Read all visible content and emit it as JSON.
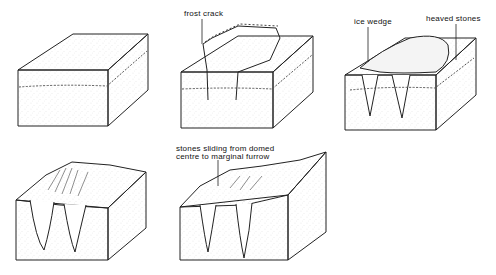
{
  "diagram": {
    "panels": [
      {
        "id": 1,
        "stage": "initial block with stone layer"
      },
      {
        "id": 2,
        "stage": "frost crack",
        "label": "frost crack"
      },
      {
        "id": 3,
        "stage": "ice wedge and heaved stones",
        "labels": [
          "ice wedge",
          "heaved stones"
        ]
      },
      {
        "id": 4,
        "stage": "domed centre with radiating stones"
      },
      {
        "id": 5,
        "stage": "stones sliding to marginal furrow",
        "label_lines": [
          "stones sliding from domed",
          "centre to marginal furrow"
        ]
      }
    ]
  },
  "labels": {
    "frost_crack": "frost crack",
    "ice_wedge": "ice wedge",
    "heaved_stones": "heaved stones",
    "stones_sliding_1": "stones sliding from domed",
    "stones_sliding_2": "centre to marginal furrow"
  },
  "colors": {
    "line": "#222222",
    "fill": "#ffffff",
    "stipple": "#9a9a9a"
  }
}
